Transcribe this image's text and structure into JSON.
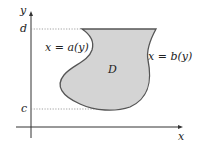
{
  "diagram": {
    "axes": {
      "x_label": "x",
      "y_label": "y"
    },
    "ticks": {
      "top": "d",
      "bottom": "c"
    },
    "region_label": "D",
    "left_boundary": "x = a(y)",
    "right_boundary": "x = b(y)",
    "colors": {
      "fill": "#d4d4d4",
      "stroke": "#555555",
      "axis": "#333333",
      "dotted": "#888888"
    }
  }
}
